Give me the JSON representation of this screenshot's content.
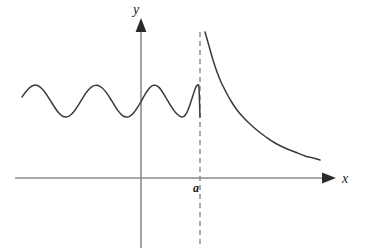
{
  "figure": {
    "kind": "math-function-graph",
    "width": 367,
    "height": 252,
    "background_color": "#ffffff",
    "labels": {
      "y_axis": "y",
      "x_axis": "x",
      "asymptote": "a"
    },
    "colors": {
      "axis": "#8c8c8c",
      "curve": "#3a3a3a",
      "asymptote": "#8f8f8f",
      "text": "#1a1a1a"
    }
  },
  "chart_data": {
    "type": "line",
    "title": "",
    "xlabel": "x",
    "ylabel": "y",
    "grid": false,
    "legend": null,
    "annotations": [
      {
        "name": "vertical-asymptote",
        "label": "a",
        "x": 200,
        "style": "dashed",
        "y_from": 32,
        "y_to": 245
      }
    ],
    "axes": {
      "x_axis_y_px": 178,
      "y_axis_x_px": 141,
      "x_axis_from_px": 15,
      "x_axis_to_px": 330,
      "y_axis_from_px": 22,
      "y_axis_to_px": 248,
      "origin_px": [
        141,
        178
      ],
      "x_arrow": true,
      "y_arrow": true
    },
    "series": [
      {
        "name": "oscillating-branch",
        "description": "Wave oscillating about a constant level with wavelength shrinking toward the vertical asymptote at x = a",
        "baseline_y_px": 101,
        "amplitude_px": 16,
        "x_start_px": 22,
        "x_end_px": 200,
        "peak_y_px": 85,
        "trough_y_px": 117,
        "points": [
          [
            22,
            97.0
          ],
          [
            26,
            91.6
          ],
          [
            30,
            87.3
          ],
          [
            34,
            85.2
          ],
          [
            38,
            85.7
          ],
          [
            42,
            88.7
          ],
          [
            46,
            93.7
          ],
          [
            50,
            99.9
          ],
          [
            54,
            106.3
          ],
          [
            58,
            112.0
          ],
          [
            62,
            115.8
          ],
          [
            66,
            117.0
          ],
          [
            70,
            115.5
          ],
          [
            74,
            111.5
          ],
          [
            78,
            105.7
          ],
          [
            82,
            99.1
          ],
          [
            86,
            92.9
          ],
          [
            90,
            88.2
          ],
          [
            94,
            85.6
          ],
          [
            98,
            85.4
          ],
          [
            102,
            87.7
          ],
          [
            106,
            92.1
          ],
          [
            110,
            98.0
          ],
          [
            114,
            104.5
          ],
          [
            118,
            110.6
          ],
          [
            122,
            115.1
          ],
          [
            126,
            117.0
          ],
          [
            130,
            116.1
          ],
          [
            134,
            112.4
          ],
          [
            138,
            106.7
          ],
          [
            141,
            101.6
          ],
          [
            144,
            96.2
          ],
          [
            147,
            91.3
          ],
          [
            150,
            87.5
          ],
          [
            153,
            85.4
          ],
          [
            156,
            85.4
          ],
          [
            159,
            87.4
          ],
          [
            162,
            91.2
          ],
          [
            165,
            96.1
          ],
          [
            168,
            101.2
          ],
          [
            171,
            106.2
          ],
          [
            174,
            110.6
          ],
          [
            177,
            114.0
          ],
          [
            180,
            116.3
          ],
          [
            182,
            116.9
          ],
          [
            184,
            116.3
          ],
          [
            186,
            114.0
          ],
          [
            188,
            110.0
          ],
          [
            190,
            104.6
          ],
          [
            192,
            98.4
          ],
          [
            194,
            92.2
          ],
          [
            195,
            89.3
          ],
          [
            196,
            86.9
          ],
          [
            197,
            85.4
          ],
          [
            198,
            85.2
          ],
          [
            199,
            88.0
          ],
          [
            200,
            117.0
          ]
        ]
      },
      {
        "name": "decaying-branch",
        "description": "Branch to the right of the asymptote falling from near the asymptote toward the x-axis",
        "x_start_px": 205,
        "x_end_px": 320,
        "y_start_px": 32,
        "y_end_px": 160,
        "points": [
          [
            205,
            32
          ],
          [
            209,
            46
          ],
          [
            213,
            60
          ],
          [
            217,
            72
          ],
          [
            221,
            82
          ],
          [
            226,
            92
          ],
          [
            231,
            101
          ],
          [
            237,
            110
          ],
          [
            243,
            117
          ],
          [
            250,
            124
          ],
          [
            258,
            131
          ],
          [
            266,
            137
          ],
          [
            275,
            143
          ],
          [
            285,
            148
          ],
          [
            295,
            152
          ],
          [
            305,
            156
          ],
          [
            313,
            158
          ],
          [
            320,
            160
          ]
        ]
      }
    ]
  }
}
